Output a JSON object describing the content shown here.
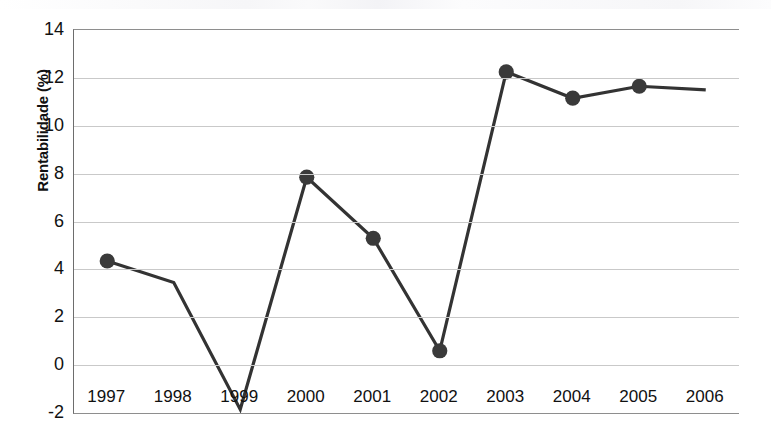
{
  "chart_data": {
    "type": "line",
    "title": "",
    "subtitle": "",
    "xlabel": "",
    "ylabel": "Rentabilidade (%)",
    "categories": [
      "1997",
      "1998",
      "1999",
      "2000",
      "2001",
      "2002",
      "2003",
      "2004",
      "2005",
      "2006"
    ],
    "values": [
      4.35,
      3.45,
      -1.85,
      7.85,
      5.3,
      0.6,
      12.25,
      11.15,
      11.65,
      11.5
    ],
    "marker_visible": [
      true,
      false,
      false,
      true,
      true,
      true,
      true,
      true,
      true,
      false
    ],
    "ylim": [
      -2,
      14
    ],
    "y_ticks": [
      "14",
      "12",
      "10",
      "8",
      "6",
      "4",
      "2",
      "0",
      "-2"
    ],
    "y_tick_values": [
      14,
      12,
      10,
      8,
      6,
      4,
      2,
      0,
      -2
    ],
    "grid": "horizontal",
    "legend": "none",
    "series": [
      {
        "name": "Rentabilidade",
        "values": [
          4.35,
          3.45,
          -1.85,
          7.85,
          5.3,
          0.6,
          12.25,
          11.15,
          11.65,
          11.5
        ]
      }
    ],
    "colors": {
      "line": "#333333",
      "marker": "#3a3a3a",
      "gridline": "#c9c9c9",
      "axis": "#8e8e8e",
      "text": "#111111"
    }
  }
}
